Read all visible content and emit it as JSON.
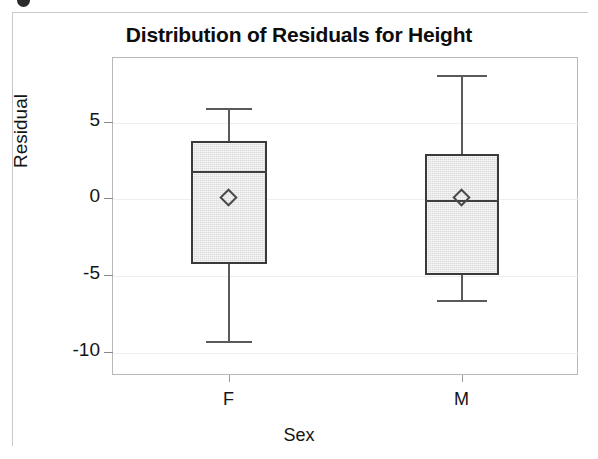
{
  "figure": {
    "title": "Distribution of Residuals for Height",
    "x_axis_title": "Sex",
    "y_axis_title": "Residual"
  },
  "style": {
    "box_fill": "#dadada",
    "box_border": "#3a3a3a",
    "whisker_color": "#5a5a5a",
    "gridline_color": "#eeeeee",
    "frame_color": "#b8b8b8",
    "text_color": "#141414"
  },
  "chart_data": {
    "type": "box",
    "title": "Distribution of Residuals for Height",
    "xlabel": "Sex",
    "ylabel": "Residual",
    "categories": [
      "F",
      "M"
    ],
    "ytick_labels": [
      "5",
      "0",
      "-5",
      "-10"
    ],
    "ytick_values": [
      5,
      0,
      -5,
      -10
    ],
    "ylim": [
      -11.5,
      9.2
    ],
    "grid": true,
    "grid_axis": "y",
    "legend": null,
    "mean_marker": "diamond",
    "boxes": [
      {
        "category": "F",
        "whisker_low": -9.3,
        "q1": -4.3,
        "median": 1.8,
        "q3": 3.7,
        "whisker_high": 5.9,
        "mean": 0.0
      },
      {
        "category": "M",
        "whisker_low": -6.6,
        "q1": -5.0,
        "median": -0.1,
        "q3": 2.9,
        "whisker_high": 8.0,
        "mean": 0.0
      }
    ]
  }
}
